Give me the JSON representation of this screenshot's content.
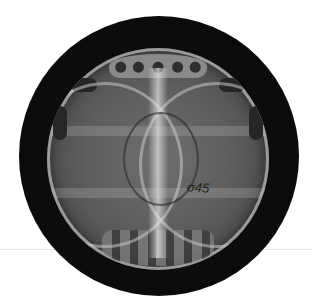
{
  "image": {
    "description": "Circular grayscale diffraction-style pattern on a black disc",
    "annotation": "σ45",
    "colors": {
      "background": "#ffffff",
      "disc": "#0b0b0b",
      "pattern_mid": "#6f6f6f",
      "highlight": "#c8c8c8"
    }
  }
}
